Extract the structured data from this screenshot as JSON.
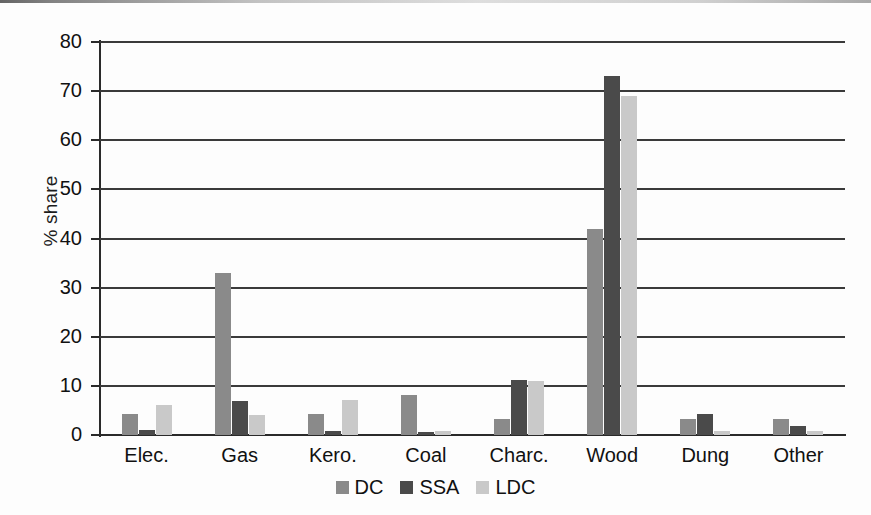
{
  "chart_data": {
    "type": "bar",
    "title": "",
    "subtitle": "",
    "xlabel": "",
    "ylabel": "% share",
    "ylim": [
      0,
      80
    ],
    "ytick_step": 10,
    "yticks": [
      80,
      70,
      60,
      50,
      40,
      30,
      20,
      10,
      0
    ],
    "grid": true,
    "grid_axis": "y",
    "legend_position": "bottom-center",
    "categories": [
      "Elec.",
      "Gas",
      "Kero.",
      "Coal",
      "Charc.",
      "Wood",
      "Dung",
      "Other"
    ],
    "series": [
      {
        "name": "DC",
        "color": "#8a8a8a",
        "values": [
          4.2,
          33,
          4.3,
          8.1,
          3.2,
          42,
          3.3,
          3.2
        ]
      },
      {
        "name": "SSA",
        "color": "#4a4a4a",
        "values": [
          1.0,
          7.0,
          0.8,
          0.7,
          11.1,
          73,
          4.2,
          1.8
        ]
      },
      {
        "name": "LDC",
        "color": "#c9c9c9",
        "values": [
          6.1,
          4.1,
          7.2,
          0.9,
          11.0,
          69,
          0.8,
          0.9
        ]
      }
    ]
  },
  "legend": {
    "items": [
      {
        "label": "DC",
        "color": "#8a8a8a"
      },
      {
        "label": "SSA",
        "color": "#4a4a4a"
      },
      {
        "label": "LDC",
        "color": "#c9c9c9"
      }
    ]
  },
  "colors": {
    "axis": "#2a2a2a",
    "grid": "#3a3a3a",
    "text": "#111111",
    "background": "#fdfdfd"
  }
}
